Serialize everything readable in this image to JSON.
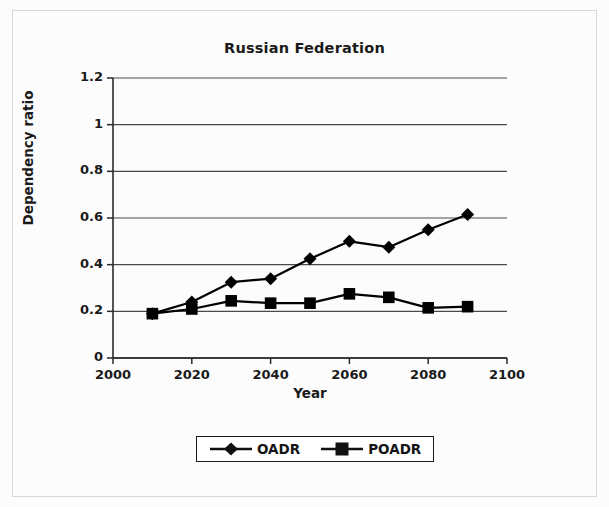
{
  "figure": {
    "title": "Russian Federation",
    "xlabel": "Year",
    "ylabel": "Dependency ratio"
  },
  "legend": {
    "items": [
      {
        "label": "OADR",
        "marker": "diamond-marker"
      },
      {
        "label": "POADR",
        "marker": "square-marker"
      }
    ]
  },
  "axis": {
    "y_ticks": [
      "0",
      "0.2",
      "0.4",
      "0.6",
      "0.8",
      "1",
      "1.2"
    ],
    "x_ticks": [
      "2000",
      "2020",
      "2040",
      "2060",
      "2080",
      "2100"
    ]
  },
  "chart_data": {
    "type": "line",
    "title": "Russian Federation",
    "xlabel": "Year",
    "ylabel": "Dependency ratio",
    "xlim": [
      2000,
      2100
    ],
    "ylim": [
      0,
      1.2
    ],
    "ytick_step": 0.2,
    "xtick_step": 20,
    "grid": "horizontal",
    "legend_position": "bottom-center",
    "x": [
      2010,
      2020,
      2030,
      2040,
      2050,
      2060,
      2070,
      2080,
      2090
    ],
    "series": [
      {
        "name": "OADR",
        "marker": "diamond",
        "color": "#000000",
        "values": [
          0.19,
          0.24,
          0.325,
          0.34,
          0.425,
          0.5,
          0.475,
          0.55,
          0.615
        ]
      },
      {
        "name": "POADR",
        "marker": "square",
        "color": "#000000",
        "values": [
          0.19,
          0.21,
          0.245,
          0.235,
          0.235,
          0.275,
          0.26,
          0.215,
          0.22
        ]
      }
    ]
  }
}
